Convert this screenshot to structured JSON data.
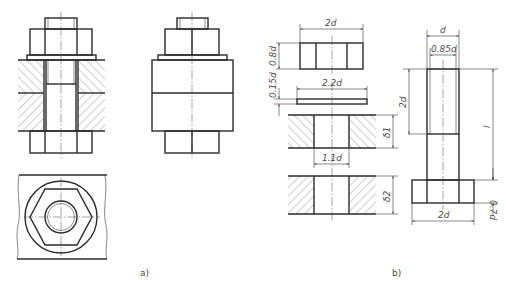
{
  "figure": {
    "captions": {
      "a": "a)",
      "b": "b)"
    },
    "views": [
      {
        "id": "a-section",
        "description": "Bolted joint, sectional front view with hatched plates"
      },
      {
        "id": "a-elevation",
        "description": "Bolted joint, external front view"
      },
      {
        "id": "a-plan",
        "description": "Top view with hexagon nut, washer circle, bolt end"
      },
      {
        "id": "b-parts",
        "description": "Exploded proportional parts: nut, washer, plates, bolt"
      }
    ],
    "dimensions": {
      "nut_width": "2d",
      "nut_height": "0.8d",
      "washer_thickness": "0.15d",
      "washer_diameter": "2.2d",
      "plate1_thickness": "δ1",
      "hole_diameter": "1.1d",
      "plate2_thickness": "δ2",
      "bolt_diameter": "d",
      "thread_minor_diameter": "0.85d",
      "thread_length": "2d",
      "bolt_length": "l",
      "head_height": "0.7d",
      "head_width": "2d"
    }
  }
}
